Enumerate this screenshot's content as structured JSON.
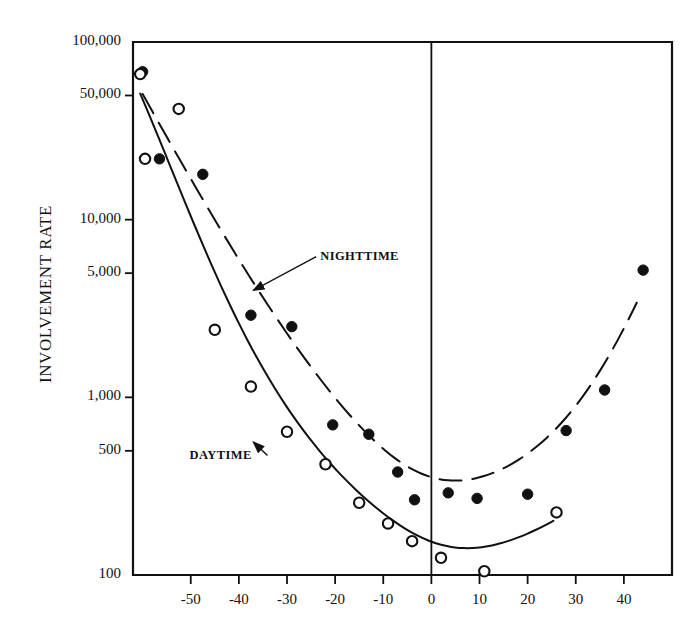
{
  "chart_data": {
    "type": "scatter",
    "title": "",
    "subtitle": "",
    "xlabel": "",
    "ylabel": "INVOLVEMENT RATE",
    "yscale": "log",
    "xscale": "linear",
    "xlim": [
      -62,
      50
    ],
    "ylim": [
      100,
      100000
    ],
    "grid": false,
    "legend_position": "inline-annotations",
    "x_ticks": [
      -50,
      -40,
      -30,
      -20,
      -10,
      0,
      10,
      20,
      30,
      40
    ],
    "x_tick_labels": [
      "-50",
      "-40",
      "-30",
      "-20",
      "-10",
      "0",
      "10",
      "20",
      "30",
      "40"
    ],
    "y_ticks": [
      100,
      500,
      1000,
      5000,
      10000,
      50000,
      100000
    ],
    "y_tick_labels": [
      "100",
      "500",
      "1,000",
      "5,000",
      "10,000",
      "50,000",
      "100,000"
    ],
    "reference_line_x": 0,
    "annotations": [
      {
        "text": "NIGHTTIME",
        "x": -26,
        "y": 6200,
        "arrow_to_x": -37,
        "arrow_to_y": 4000
      },
      {
        "text": "DAYTIME",
        "x": -49,
        "y": 470,
        "arrow_to_x": -37,
        "arrow_to_y": 560
      }
    ],
    "series": [
      {
        "name": "NIGHTTIME",
        "marker": "filled-circle",
        "line_style": "dashed",
        "points": [
          {
            "x": -60.0,
            "y": 68000
          },
          {
            "x": -56.5,
            "y": 22000
          },
          {
            "x": -47.5,
            "y": 18000
          },
          {
            "x": -37.5,
            "y": 2900
          },
          {
            "x": -29.0,
            "y": 2500
          },
          {
            "x": -20.5,
            "y": 700
          },
          {
            "x": -13.0,
            "y": 620
          },
          {
            "x": -7.0,
            "y": 380
          },
          {
            "x": -3.5,
            "y": 265
          },
          {
            "x": 3.5,
            "y": 290
          },
          {
            "x": 9.5,
            "y": 270
          },
          {
            "x": 20.0,
            "y": 285
          },
          {
            "x": 28.0,
            "y": 650
          },
          {
            "x": 36.0,
            "y": 1100
          },
          {
            "x": 44.0,
            "y": 5200
          }
        ]
      },
      {
        "name": "DAYTIME",
        "marker": "open-circle",
        "line_style": "solid",
        "points": [
          {
            "x": -60.5,
            "y": 66000
          },
          {
            "x": -59.5,
            "y": 22000
          },
          {
            "x": -52.5,
            "y": 42000
          },
          {
            "x": -45.0,
            "y": 2400
          },
          {
            "x": -37.5,
            "y": 1150
          },
          {
            "x": -30.0,
            "y": 640
          },
          {
            "x": -22.0,
            "y": 420
          },
          {
            "x": -15.0,
            "y": 255
          },
          {
            "x": -9.0,
            "y": 195
          },
          {
            "x": -4.0,
            "y": 155
          },
          {
            "x": 2.0,
            "y": 125
          },
          {
            "x": 11.0,
            "y": 105
          },
          {
            "x": 26.0,
            "y": 225
          }
        ]
      }
    ]
  },
  "axes": {
    "y_title": "INVOLVEMENT RATE"
  }
}
